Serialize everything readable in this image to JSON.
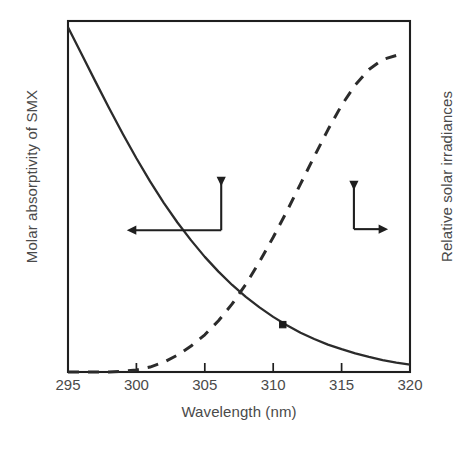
{
  "chart_data": {
    "type": "line",
    "title": "",
    "xlabel": "Wavelength (nm)",
    "ylabel_left": "Molar absorptivity of SMX",
    "ylabel_right": "Relative solar irradiances",
    "xlim": [
      295,
      320
    ],
    "xticks": [
      295,
      300,
      305,
      310,
      315,
      320
    ],
    "xticklabels": [
      "295",
      "300",
      "305",
      "310",
      "315",
      "320"
    ],
    "ylim_left": [
      0,
      1
    ],
    "ylim_right": [
      0,
      1
    ],
    "yticks_left": [],
    "yticks_right": [],
    "grid": false,
    "legend": "none",
    "frame": "box",
    "series": [
      {
        "name": "Molar absorptivity of SMX",
        "axis": "left",
        "style": "solid",
        "color": "#2b2b2b",
        "x": [
          295,
          296,
          297,
          298,
          299,
          300,
          301,
          302,
          303,
          304,
          305,
          306,
          307,
          308,
          309,
          310,
          311,
          312,
          313,
          314,
          315,
          316,
          317,
          318,
          319,
          320
        ],
        "y": [
          0.982,
          0.905,
          0.828,
          0.752,
          0.679,
          0.609,
          0.543,
          0.482,
          0.426,
          0.375,
          0.328,
          0.286,
          0.248,
          0.214,
          0.184,
          0.157,
          0.133,
          0.112,
          0.094,
          0.078,
          0.065,
          0.053,
          0.043,
          0.034,
          0.027,
          0.021
        ]
      },
      {
        "name": "Relative solar irradiances",
        "axis": "right",
        "style": "dashed",
        "color": "#2b2b2b",
        "x": [
          295,
          296,
          297,
          298,
          299,
          300,
          301,
          302,
          303,
          304,
          305,
          306,
          307,
          308,
          309,
          310,
          311,
          312,
          313,
          314,
          315,
          316,
          317,
          318,
          319
        ],
        "y": [
          0.0,
          0.0,
          0.0,
          0.0,
          0.002,
          0.006,
          0.014,
          0.028,
          0.048,
          0.074,
          0.106,
          0.146,
          0.194,
          0.25,
          0.314,
          0.384,
          0.458,
          0.536,
          0.614,
          0.69,
          0.76,
          0.818,
          0.862,
          0.89,
          0.902
        ]
      }
    ],
    "markers": [
      {
        "label": "",
        "series": "Molar absorptivity of SMX",
        "x": 310.7,
        "y": 0.135,
        "shape": "square",
        "color": "#1a1a1a"
      }
    ],
    "annotations": [
      {
        "name": "left-axis-pointer",
        "kind": "elbow-arrow",
        "corner_x": 306.2,
        "corner_y_frac": 0.404,
        "arm_left_to_x": 299.3,
        "arm_down_to_y_frac": 0.529,
        "points_to": "left",
        "target_axis": "left"
      },
      {
        "name": "right-axis-pointer",
        "kind": "elbow-arrow",
        "corner_x": 315.9,
        "corner_y_frac": 0.407,
        "arm_right_to_x": 318.4,
        "arm_down_to_y_frac": 0.518,
        "points_to": "right",
        "target_axis": "right"
      }
    ]
  },
  "colors": {
    "curve": "#2b2b2b",
    "frame": "#1f1f1f",
    "text": "#4a4a4a",
    "background": "#ffffff"
  }
}
